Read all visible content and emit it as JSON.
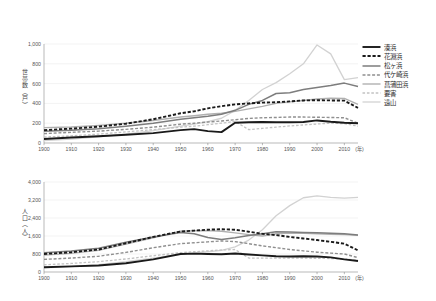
{
  "figure": {
    "background": "#ffffff",
    "x_axis": {
      "label_suffix": "(年)",
      "ticks": [
        1900,
        1910,
        1920,
        1930,
        1940,
        1950,
        1960,
        1970,
        1980,
        1990,
        2000,
        2010
      ],
      "min": 1900,
      "max": 2015
    }
  },
  "legend": {
    "position": "right",
    "items": [
      {
        "label": "湊浜",
        "key": "minatohama",
        "color": "#1a1a1a",
        "width": 1.9,
        "dash": "none"
      },
      {
        "label": "花淵浜",
        "key": "hanabuchihama",
        "color": "#1a1a1a",
        "width": 1.9,
        "dash": "3.2,1.8"
      },
      {
        "label": "松ヶ浜",
        "key": "matsugahama",
        "color": "#7d7d7d",
        "width": 1.5,
        "dash": "none"
      },
      {
        "label": "代ケ崎浜",
        "key": "yogasakihama",
        "color": "#8f8f8f",
        "width": 1.4,
        "dash": "3.0,1.8"
      },
      {
        "label": "菖蒲田浜",
        "key": "shobutahama",
        "color": "#b0b0b0",
        "width": 1.4,
        "dash": "none"
      },
      {
        "label": "要害",
        "key": "yogai",
        "color": "#c2c2c2",
        "width": 1.3,
        "dash": "2.6,1.8"
      },
      {
        "label": "遠山",
        "key": "toyama",
        "color": "#d2d2d2",
        "width": 1.3,
        "dash": "none"
      }
    ]
  },
  "chart_data": [
    {
      "id": "households",
      "type": "line",
      "title": "",
      "xlabel": "(年)",
      "ylabel": "世帯数（戸）",
      "ylabel_plain": "世帯数(戸)",
      "grid": true,
      "legend_position": "right",
      "xlim": [
        1900,
        2015
      ],
      "ylim": [
        0,
        1000
      ],
      "yticks": [
        0,
        200,
        400,
        600,
        800,
        1000
      ],
      "ytick_labels": [
        "0",
        "200",
        "400",
        "600",
        "800",
        "1,000"
      ],
      "x": [
        1900,
        1910,
        1920,
        1930,
        1940,
        1950,
        1955,
        1960,
        1965,
        1970,
        1975,
        1980,
        1985,
        1990,
        1995,
        2000,
        2005,
        2010,
        2015
      ],
      "series": [
        {
          "name": "湊浜",
          "values": [
            40,
            55,
            68,
            84,
            100,
            130,
            140,
            120,
            110,
            205,
            210,
            212,
            210,
            210,
            212,
            228,
            215,
            205,
            200
          ]
        },
        {
          "name": "花淵浜",
          "values": [
            130,
            145,
            165,
            195,
            240,
            300,
            320,
            350,
            372,
            390,
            400,
            408,
            412,
            420,
            430,
            432,
            430,
            428,
            355
          ]
        },
        {
          "name": "松ヶ浜",
          "values": [
            118,
            128,
            145,
            170,
            200,
            240,
            255,
            270,
            290,
            330,
            390,
            430,
            500,
            508,
            540,
            560,
            580,
            605,
            570
          ]
        },
        {
          "name": "代ケ崎浜",
          "values": [
            95,
            108,
            120,
            138,
            160,
            190,
            200,
            212,
            222,
            235,
            248,
            255,
            258,
            262,
            262,
            260,
            258,
            255,
            200
          ]
        },
        {
          "name": "菖蒲田浜",
          "values": [
            155,
            162,
            178,
            200,
            228,
            262,
            275,
            290,
            300,
            320,
            345,
            370,
            400,
            415,
            430,
            445,
            452,
            450,
            390
          ]
        },
        {
          "name": "要害",
          "values": [
            60,
            72,
            90,
            112,
            135,
            160,
            170,
            185,
            200,
            218,
            135,
            148,
            160,
            172,
            182,
            192,
            200,
            195,
            170
          ]
        },
        {
          "name": "遠山",
          "values": [
            25,
            40,
            62,
            90,
            125,
            170,
            190,
            215,
            250,
            330,
            430,
            540,
            610,
            700,
            800,
            990,
            900,
            640,
            660
          ]
        }
      ]
    },
    {
      "id": "population",
      "type": "line",
      "title": "",
      "xlabel": "(年)",
      "ylabel": "人口（人）",
      "ylabel_plain": "人口(人)",
      "grid": true,
      "legend_position": "right",
      "xlim": [
        1900,
        2015
      ],
      "ylim": [
        0,
        4000
      ],
      "yticks": [
        0,
        800,
        1600,
        2400,
        3200,
        4000
      ],
      "ytick_labels": [
        "0",
        "800",
        "1,600",
        "2,400",
        "3,200",
        "4,000"
      ],
      "x": [
        1900,
        1910,
        1920,
        1930,
        1940,
        1950,
        1955,
        1960,
        1965,
        1970,
        1975,
        1980,
        1985,
        1990,
        1995,
        2000,
        2005,
        2010,
        2015
      ],
      "series": [
        {
          "name": "湊浜",
          "values": [
            210,
            250,
            290,
            390,
            560,
            800,
            815,
            800,
            790,
            820,
            780,
            740,
            700,
            690,
            700,
            690,
            650,
            560,
            490
          ]
        },
        {
          "name": "花淵浜",
          "values": [
            800,
            880,
            1000,
            1280,
            1560,
            1800,
            1840,
            1880,
            1900,
            1880,
            1790,
            1700,
            1640,
            1560,
            1490,
            1420,
            1340,
            1260,
            960
          ]
        },
        {
          "name": "松ヶ浜",
          "values": [
            860,
            930,
            1060,
            1320,
            1560,
            1760,
            1700,
            1530,
            1440,
            1520,
            1620,
            1700,
            1790,
            1780,
            1760,
            1740,
            1720,
            1700,
            1640
          ]
        },
        {
          "name": "代ケ崎浜",
          "values": [
            560,
            620,
            700,
            870,
            1080,
            1260,
            1300,
            1340,
            1380,
            1350,
            1260,
            1160,
            1080,
            1000,
            940,
            880,
            840,
            800,
            640
          ]
        },
        {
          "name": "菖蒲田浜",
          "values": [
            750,
            830,
            960,
            1240,
            1520,
            1810,
            1830,
            1840,
            1810,
            1740,
            1660,
            1600,
            1700,
            1730,
            1720,
            1700,
            1680,
            1660,
            1630
          ]
        },
        {
          "name": "要害",
          "values": [
            320,
            380,
            460,
            580,
            720,
            860,
            900,
            940,
            980,
            1000,
            620,
            620,
            620,
            620,
            615,
            610,
            600,
            580,
            520
          ]
        },
        {
          "name": "遠山",
          "values": [
            180,
            240,
            330,
            460,
            620,
            790,
            850,
            900,
            960,
            1120,
            1420,
            1880,
            2500,
            2950,
            3300,
            3380,
            3320,
            3280,
            3320
          ]
        }
      ]
    }
  ]
}
